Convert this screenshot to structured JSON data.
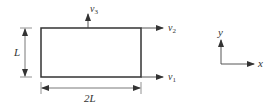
{
  "diagram": {
    "type": "plate-with-velocities",
    "rectangle": {
      "width_label": "2L",
      "height_label": "L"
    },
    "velocities": [
      {
        "id": "v1",
        "label": "v",
        "subscript": "1",
        "direction": "right",
        "location": "bottom-right corner"
      },
      {
        "id": "v2",
        "label": "v",
        "subscript": "2",
        "direction": "right",
        "location": "top-right corner"
      },
      {
        "id": "v3",
        "label": "v",
        "subscript": "3",
        "direction": "up",
        "location": "top edge midpoint"
      }
    ],
    "axes": {
      "x_label": "x",
      "y_label": "y"
    },
    "colors": {
      "line": "#444444",
      "rect_stroke": "#333333",
      "background": "#ffffff"
    }
  }
}
